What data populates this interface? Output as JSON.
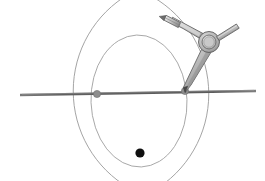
{
  "figure": {
    "canvas": {
      "width": 265,
      "height": 181,
      "background": "#ffffff"
    },
    "colors": {
      "background": "#ffffff",
      "arc_stroke": "#9a9a9a",
      "circle_stroke": "#a0a0a0",
      "baseline_stroke": "#6b6b6b",
      "baseline_highlight": "#9d9d9d",
      "marked_point": "#8d8d8d",
      "marked_point_outline": "#6f6f6f",
      "solid_point": "#0f0f0f",
      "compass_body_light": "#d2d2d2",
      "compass_body_mid": "#a8a8a8",
      "compass_body_dark": "#7c7c7c",
      "compass_outline": "#5e5e5e",
      "compass_metal_light": "#e3e3e3",
      "compass_metal_dark": "#8a8a8a"
    },
    "elements": {
      "baseline": {
        "name": "horizontal-base-line",
        "x1": 20,
        "y1": 95,
        "x2": 256,
        "y2": 91,
        "stroke_width": 2.4
      },
      "marked_points": [
        {
          "name": "left-center-point",
          "cx": 97,
          "cy": 94,
          "r": 3.6,
          "label": "A"
        },
        {
          "name": "right-center-point",
          "cx": 185,
          "cy": 91,
          "r": 3.6,
          "label": "B"
        }
      ],
      "solid_point": {
        "name": "intersection-dot",
        "cx": 140,
        "cy": 153,
        "r": 4.6
      },
      "arcs": [
        {
          "name": "arc-from-left-center",
          "cx": 97,
          "cy": 94,
          "r": 112,
          "start_deg": 300,
          "end_deg": 60,
          "stroke_width": 0.9
        },
        {
          "name": "arc-from-right-center",
          "cx": 185,
          "cy": 91,
          "r": 112,
          "start_deg": 120,
          "end_deg": 240,
          "stroke_width": 0.9
        }
      ],
      "circle": {
        "name": "construction-circle",
        "cx": 139,
        "cy": 101,
        "rx": 48,
        "ry": 66,
        "rotation_deg": -2,
        "stroke_width": 0.9
      },
      "compass": {
        "name": "drawing-compass",
        "needle_point": {
          "x": 185,
          "y": 92
        },
        "pivot": {
          "cx": 209,
          "cy": 42,
          "r_outer": 10.5,
          "r_inner": 7.0
        },
        "pencil_arm": {
          "from": {
            "x": 163,
            "y": 19
          },
          "to": {
            "x": 205,
            "y": 38
          }
        },
        "needle_arm": {
          "from": {
            "x": 209,
            "y": 47
          },
          "to": {
            "x": 185,
            "y": 92
          }
        },
        "adjust_screw": {
          "from": {
            "x": 218,
            "y": 38
          },
          "to": {
            "x": 238,
            "y": 27
          }
        },
        "pencil_tip": {
          "x": 160,
          "y": 17
        }
      }
    }
  }
}
